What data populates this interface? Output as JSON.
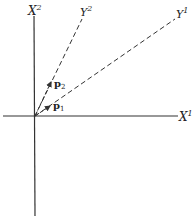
{
  "diagram": {
    "axes": {
      "x1": {
        "label": "X",
        "superscript": "1"
      },
      "x2": {
        "label": "X",
        "superscript": "2"
      }
    },
    "oblique_axes": {
      "y1": {
        "label": "Y",
        "superscript": "1",
        "style": "dashed"
      },
      "y2": {
        "label": "Y",
        "superscript": "2",
        "style": "dashed"
      }
    },
    "vectors": {
      "p1": {
        "label": "p",
        "subscript": "1"
      },
      "p2": {
        "label": "p",
        "subscript": "2"
      }
    },
    "colors": {
      "line": "#333333",
      "background": "#ffffff"
    }
  }
}
